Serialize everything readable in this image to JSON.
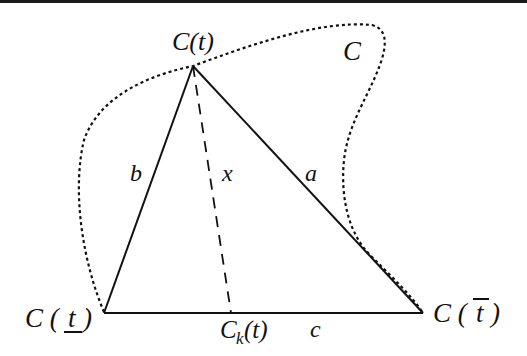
{
  "diagram": {
    "type": "geometric-figure",
    "colors": {
      "ink": "#111111",
      "background": "#ffffff"
    },
    "curve": {
      "label": "C",
      "style": "dotted"
    },
    "vertices": {
      "apex": {
        "label": "C(t)",
        "x": 193,
        "y": 66
      },
      "left": {
        "label_main": "C (",
        "label_var": "t",
        "label_close": ")",
        "decoration": "underline",
        "x": 104,
        "y": 313
      },
      "right": {
        "label_main": "C (",
        "label_var": "t",
        "label_close": ")",
        "decoration": "overline",
        "x": 423,
        "y": 313
      },
      "foot": {
        "label_main": "C",
        "label_sub": "k",
        "label_arg": "(t)",
        "x": 231,
        "y": 313
      }
    },
    "edges": {
      "a": {
        "label": "a",
        "from": "apex",
        "to": "right",
        "style": "solid"
      },
      "b": {
        "label": "b",
        "from": "apex",
        "to": "left",
        "style": "solid"
      },
      "c": {
        "label": "c",
        "from": "left",
        "to": "right",
        "style": "solid"
      },
      "x": {
        "label": "x",
        "from": "apex",
        "to": "foot",
        "style": "dashed"
      }
    }
  }
}
